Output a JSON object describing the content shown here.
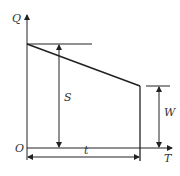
{
  "diagram": {
    "type": "inventory-level-graph",
    "axes": {
      "y_label": "Q",
      "x_label": "T",
      "origin_label": "O"
    },
    "annotations": {
      "s_label": "S",
      "w_label": "W",
      "t_label": "t"
    },
    "colors": {
      "line": "#222222",
      "text": "#333333",
      "background": "#ffffff"
    }
  }
}
